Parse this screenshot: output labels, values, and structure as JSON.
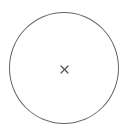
{
  "close_button": {
    "icon": "close-icon",
    "label": "Close",
    "stroke_color": "#666666",
    "icon_color": "#555555"
  }
}
